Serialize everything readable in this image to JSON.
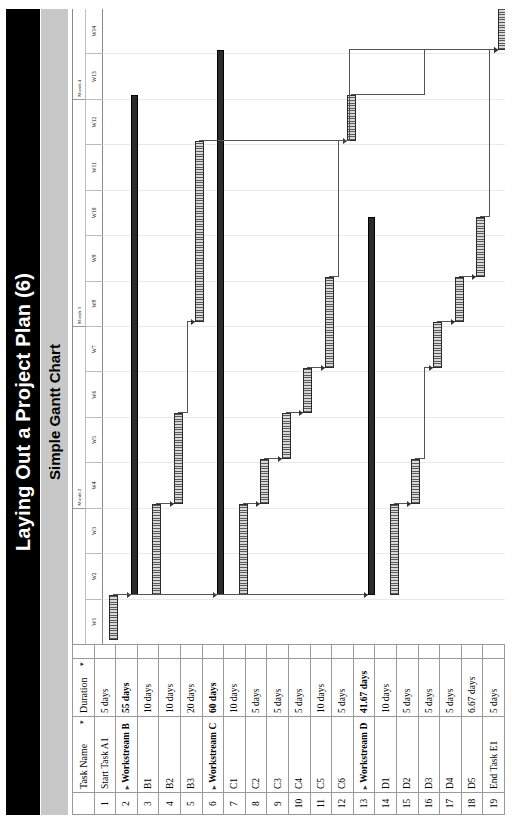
{
  "header": {
    "title": "Laying Out a Project Plan (6)",
    "subtitle": "Simple Gantt Chart"
  },
  "table": {
    "columns": {
      "index": "",
      "indicator": "",
      "task_name": "Task Name",
      "duration": "Duration",
      "task_name_caret": "▾",
      "duration_caret": "▾"
    },
    "rows": [
      {
        "index": "1",
        "indicator": "",
        "task_name": "Start Task A1",
        "duration": "5 days",
        "summary": false
      },
      {
        "index": "2",
        "indicator": "",
        "task_name": "Workstream B",
        "duration": "55 days",
        "summary": true
      },
      {
        "index": "3",
        "indicator": "",
        "task_name": "B1",
        "duration": "10 days",
        "summary": false
      },
      {
        "index": "4",
        "indicator": "",
        "task_name": "B2",
        "duration": "10 days",
        "summary": false
      },
      {
        "index": "5",
        "indicator": "",
        "task_name": "B3",
        "duration": "20 days",
        "summary": false
      },
      {
        "index": "6",
        "indicator": "",
        "task_name": "Workstream C",
        "duration": "60 days",
        "summary": true
      },
      {
        "index": "7",
        "indicator": "",
        "task_name": "C1",
        "duration": "10 days",
        "summary": false
      },
      {
        "index": "8",
        "indicator": "",
        "task_name": "C2",
        "duration": "5 days",
        "summary": false
      },
      {
        "index": "9",
        "indicator": "",
        "task_name": "C3",
        "duration": "5 days",
        "summary": false
      },
      {
        "index": "10",
        "indicator": "",
        "task_name": "C4",
        "duration": "5 days",
        "summary": false
      },
      {
        "index": "11",
        "indicator": "",
        "task_name": "C5",
        "duration": "10 days",
        "summary": false
      },
      {
        "index": "12",
        "indicator": "",
        "task_name": "C6",
        "duration": "5 days",
        "summary": false
      },
      {
        "index": "13",
        "indicator": "",
        "task_name": "Workstream D",
        "duration": "41.67 days",
        "summary": true
      },
      {
        "index": "14",
        "indicator": "",
        "task_name": "D1",
        "duration": "10 days",
        "summary": false
      },
      {
        "index": "15",
        "indicator": "",
        "task_name": "D2",
        "duration": "5 days",
        "summary": false
      },
      {
        "index": "16",
        "indicator": "",
        "task_name": "D3",
        "duration": "5 days",
        "summary": false
      },
      {
        "index": "17",
        "indicator": "",
        "task_name": "D4",
        "duration": "5 days",
        "summary": false
      },
      {
        "index": "18",
        "indicator": "",
        "task_name": "D5",
        "duration": "6.67 days",
        "summary": false
      },
      {
        "index": "19",
        "indicator": "",
        "task_name": "End Task E1",
        "duration": "5 days",
        "summary": false
      }
    ]
  },
  "chart_data": {
    "type": "bar",
    "title": "Simple Gantt Chart",
    "xlabel": "",
    "ylabel": "",
    "grid": true,
    "legend": "none",
    "timeline": {
      "unit": "week",
      "weeks": [
        "W1",
        "W2",
        "W3",
        "W4",
        "W5",
        "W6",
        "W7",
        "W8",
        "W9",
        "W10",
        "W11",
        "W12",
        "W13",
        "W14"
      ],
      "months": [
        {
          "label": "",
          "start_week": 1,
          "span_weeks": 3
        },
        {
          "label": "Month 2",
          "start_week": 4,
          "span_weeks": 4
        },
        {
          "label": "Month 3",
          "start_week": 8,
          "span_weeks": 5
        },
        {
          "label": "Month 4",
          "start_week": 13,
          "span_weeks": 2
        }
      ],
      "xlim": [
        0,
        14
      ]
    },
    "categories": [
      "Start Task A1",
      "Workstream B",
      "B1",
      "B2",
      "B3",
      "Workstream C",
      "C1",
      "C2",
      "C3",
      "C4",
      "C5",
      "C6",
      "Workstream D",
      "D1",
      "D2",
      "D3",
      "D4",
      "D5",
      "End Task E1"
    ],
    "bars": [
      {
        "row": 1,
        "task": "Start Task A1",
        "start_week": 0.1,
        "duration_weeks": 1.0,
        "summary": false
      },
      {
        "row": 2,
        "task": "Workstream B",
        "start_week": 1.1,
        "duration_weeks": 11.0,
        "summary": true
      },
      {
        "row": 3,
        "task": "B1",
        "start_week": 1.1,
        "duration_weeks": 2.0,
        "summary": false
      },
      {
        "row": 4,
        "task": "B2",
        "start_week": 3.1,
        "duration_weeks": 2.0,
        "summary": false
      },
      {
        "row": 5,
        "task": "B3",
        "start_week": 7.1,
        "duration_weeks": 4.0,
        "summary": false
      },
      {
        "row": 6,
        "task": "Workstream C",
        "start_week": 1.1,
        "duration_weeks": 12.0,
        "summary": true
      },
      {
        "row": 7,
        "task": "C1",
        "start_week": 1.1,
        "duration_weeks": 2.0,
        "summary": false
      },
      {
        "row": 8,
        "task": "C2",
        "start_week": 3.1,
        "duration_weeks": 1.0,
        "summary": false
      },
      {
        "row": 9,
        "task": "C3",
        "start_week": 4.1,
        "duration_weeks": 1.0,
        "summary": false
      },
      {
        "row": 10,
        "task": "C4",
        "start_week": 5.1,
        "duration_weeks": 1.0,
        "summary": false
      },
      {
        "row": 11,
        "task": "C5",
        "start_week": 6.1,
        "duration_weeks": 2.0,
        "summary": false
      },
      {
        "row": 12,
        "task": "C6",
        "start_week": 11.1,
        "duration_weeks": 1.0,
        "summary": false
      },
      {
        "row": 13,
        "task": "Workstream D",
        "start_week": 1.1,
        "duration_weeks": 8.33,
        "summary": true
      },
      {
        "row": 14,
        "task": "D1",
        "start_week": 1.1,
        "duration_weeks": 2.0,
        "summary": false
      },
      {
        "row": 15,
        "task": "D2",
        "start_week": 3.1,
        "duration_weeks": 1.0,
        "summary": false
      },
      {
        "row": 16,
        "task": "D3",
        "start_week": 6.1,
        "duration_weeks": 1.0,
        "summary": false
      },
      {
        "row": 17,
        "task": "D4",
        "start_week": 7.1,
        "duration_weeks": 1.0,
        "summary": false
      },
      {
        "row": 18,
        "task": "D5",
        "start_week": 8.1,
        "duration_weeks": 1.33,
        "summary": false
      },
      {
        "row": 19,
        "task": "End Task E1",
        "start_week": 13.1,
        "duration_weeks": 1.0,
        "summary": false
      }
    ]
  },
  "colors": {
    "title_bar_bg": "#000000",
    "title_bar_text": "#ffffff",
    "subtitle_bg": "#c8c8c8",
    "bar_fill": "#5a5a5a",
    "bar_border": "#2b2b2b",
    "summary_bar": "#2b2b2b",
    "link_line": "#545454",
    "grid_line": "#e9e9e9"
  }
}
